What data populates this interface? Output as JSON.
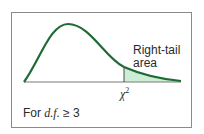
{
  "diagram": {
    "type": "chi-square distribution curve",
    "annotation": {
      "line1": "Right-tail",
      "line2": "area"
    },
    "critical_value_label": {
      "symbol": "χ",
      "superscript": "2"
    },
    "footnote": {
      "prefix": "For ",
      "italic": "d.f.",
      "suffix": " ≥ 3"
    },
    "colors": {
      "curve": "#1f6b35",
      "shade": "#cdeed5",
      "axis": "#7a7a7a",
      "border": "#8a8a8a"
    }
  }
}
